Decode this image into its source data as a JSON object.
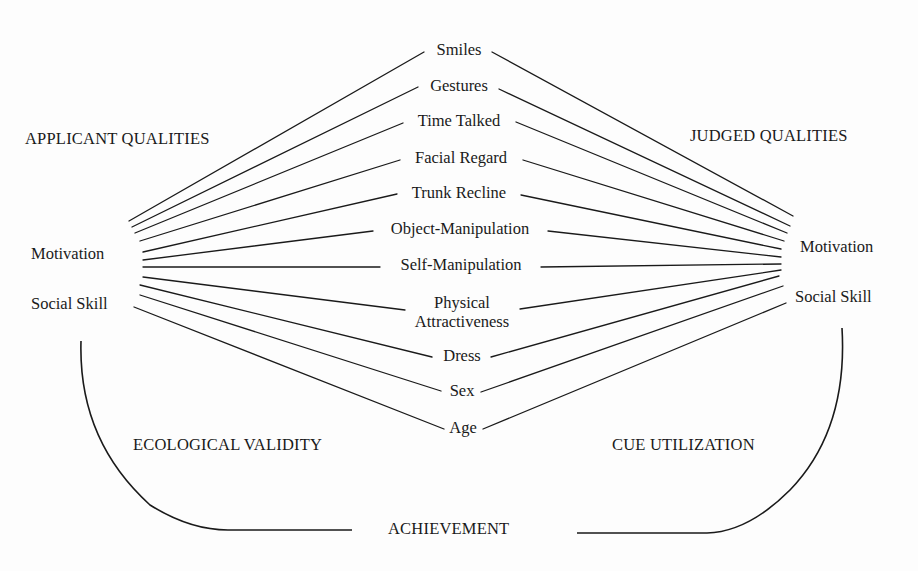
{
  "left_group": {
    "heading": "APPLICANT QUALITIES",
    "items": [
      "Motivation",
      "Social Skill"
    ]
  },
  "right_group": {
    "heading": "JUDGED QUALITIES",
    "items": [
      "Motivation",
      "Social Skill"
    ]
  },
  "cues": [
    {
      "label": "Smiles"
    },
    {
      "label": "Gestures"
    },
    {
      "label": "Time Talked"
    },
    {
      "label": "Facial Regard"
    },
    {
      "label": "Trunk Recline"
    },
    {
      "label": "Object-Manipulation"
    },
    {
      "label": "Self-Manipulation"
    },
    {
      "label": "Physical",
      "label2": "Attractiveness"
    },
    {
      "label": "Dress"
    },
    {
      "label": "Sex"
    },
    {
      "label": "Age"
    }
  ],
  "bottom": {
    "left_label": "ECOLOGICAL VALIDITY",
    "right_label": "CUE UTILIZATION",
    "center_label": "ACHIEVEMENT"
  },
  "colors": {
    "ink": "#1a1a1a",
    "background": "#fdfdfd"
  }
}
